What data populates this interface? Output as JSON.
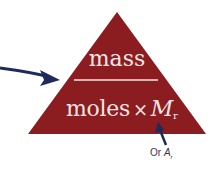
{
  "diagram": {
    "type": "formula-triangle",
    "colors": {
      "triangle": "#8b1c20",
      "text": "#f3e6e6",
      "arrow": "#1f2a5c",
      "note": "#2a3a6a"
    },
    "top": {
      "text": "mass"
    },
    "bottom": {
      "left": "moles",
      "operator": "×",
      "right": "M",
      "right_sub": "r"
    },
    "note": {
      "prefix": "Or",
      "symbol": "A",
      "symbol_sub": "r"
    }
  }
}
